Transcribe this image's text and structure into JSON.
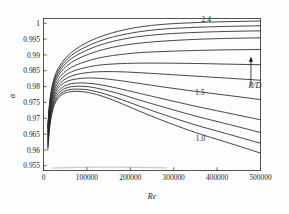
{
  "chart_data": {
    "type": "line",
    "title": "",
    "xlabel": "Re",
    "ylabel": "α",
    "xlim": [
      0,
      500000
    ],
    "ylim": [
      0.9535,
      1.0015
    ],
    "grid": false,
    "legend_position": "inline-annotations",
    "xticks": [
      0,
      100000,
      200000,
      300000,
      400000,
      500000
    ],
    "xtick_labels": [
      "0",
      "100000",
      "200000",
      "300000",
      "400000",
      "500000"
    ],
    "yticks": [
      0.955,
      0.96,
      0.965,
      0.97,
      0.975,
      0.98,
      0.985,
      0.99,
      0.995,
      1
    ],
    "ytick_labels": [
      "0.955",
      "0.96",
      "0.965",
      "0.97",
      "0.975",
      "0.98",
      "0.985",
      "0.99",
      "0.995",
      "1"
    ],
    "annotations": [
      {
        "text": "2.4",
        "x": 375000,
        "y": 1.0005,
        "name": "curve-label-2-4"
      },
      {
        "text": "1.5",
        "x": 360000,
        "y": 0.9772,
        "name": "curve-label-1-5"
      },
      {
        "text": "1.0",
        "x": 362000,
        "y": 0.9628,
        "name": "curve-label-1-0"
      },
      {
        "text": "R/D",
        "x": 487000,
        "y": 0.9795,
        "name": "ratio-axis-label"
      }
    ],
    "direction_arrow": {
      "name": "r-over-d-increase-arrow",
      "description": "upward arrow indicating increasing R/D",
      "x": 478000,
      "y_start": 0.9805,
      "y_end": 0.9895
    },
    "series": [
      {
        "name": "R/D = 1.0",
        "label": "1.0",
        "x": [
          10000,
          14000,
          20000,
          28000,
          40000,
          55000,
          75000,
          100000,
          130000,
          170000,
          220000,
          280000,
          350000,
          420000,
          500000
        ],
        "values": [
          0.96,
          0.9668,
          0.9718,
          0.9751,
          0.9772,
          0.9782,
          0.9785,
          0.9782,
          0.9772,
          0.9752,
          0.9723,
          0.969,
          0.9655,
          0.9625,
          0.959
        ]
      },
      {
        "name": "R/D = 1.13",
        "label": "",
        "x": [
          10000,
          14000,
          20000,
          28000,
          40000,
          55000,
          75000,
          100000,
          130000,
          170000,
          220000,
          280000,
          350000,
          420000,
          500000
        ],
        "values": [
          0.9608,
          0.9676,
          0.9726,
          0.9758,
          0.9778,
          0.9789,
          0.9792,
          0.979,
          0.9781,
          0.9764,
          0.9739,
          0.971,
          0.9679,
          0.9652,
          0.9621
        ]
      },
      {
        "name": "R/D = 1.26",
        "label": "",
        "x": [
          10000,
          14000,
          20000,
          28000,
          40000,
          55000,
          75000,
          100000,
          130000,
          170000,
          220000,
          280000,
          350000,
          420000,
          500000
        ],
        "values": [
          0.9616,
          0.9684,
          0.9734,
          0.9766,
          0.9786,
          0.9797,
          0.9801,
          0.98,
          0.9793,
          0.9779,
          0.9758,
          0.9734,
          0.9707,
          0.9683,
          0.9655
        ]
      },
      {
        "name": "R/D = 1.38",
        "label": "",
        "x": [
          10000,
          14000,
          20000,
          28000,
          40000,
          55000,
          75000,
          100000,
          130000,
          170000,
          220000,
          280000,
          350000,
          420000,
          500000
        ],
        "values": [
          0.9624,
          0.9692,
          0.9742,
          0.9774,
          0.9794,
          0.9806,
          0.9811,
          0.9811,
          0.9806,
          0.9795,
          0.9779,
          0.976,
          0.9738,
          0.9718,
          0.9695
        ]
      },
      {
        "name": "R/D = 1.5",
        "label": "1.5",
        "x": [
          10000,
          14000,
          20000,
          28000,
          40000,
          55000,
          75000,
          100000,
          130000,
          170000,
          220000,
          280000,
          350000,
          420000,
          500000
        ],
        "values": [
          0.9632,
          0.97,
          0.975,
          0.9783,
          0.9804,
          0.9817,
          0.9824,
          0.9827,
          0.9826,
          0.982,
          0.981,
          0.9798,
          0.9785,
          0.9773,
          0.9759
        ]
      },
      {
        "name": "R/D = 1.62",
        "label": "",
        "x": [
          10000,
          14000,
          20000,
          28000,
          40000,
          55000,
          75000,
          100000,
          130000,
          170000,
          220000,
          280000,
          350000,
          420000,
          500000
        ],
        "values": [
          0.964,
          0.9708,
          0.9758,
          0.9791,
          0.9813,
          0.9828,
          0.9838,
          0.9844,
          0.9847,
          0.9847,
          0.9844,
          0.9839,
          0.9833,
          0.9827,
          0.982
        ]
      },
      {
        "name": "R/D = 1.75",
        "label": "",
        "x": [
          10000,
          14000,
          20000,
          28000,
          40000,
          55000,
          75000,
          100000,
          130000,
          170000,
          220000,
          280000,
          350000,
          420000,
          500000
        ],
        "values": [
          0.9648,
          0.9716,
          0.9766,
          0.98,
          0.9823,
          0.984,
          0.9852,
          0.9861,
          0.9868,
          0.9872,
          0.9874,
          0.9874,
          0.9873,
          0.9871,
          0.9869
        ]
      },
      {
        "name": "R/D = 1.9",
        "label": "",
        "x": [
          10000,
          14000,
          20000,
          28000,
          40000,
          55000,
          75000,
          100000,
          130000,
          170000,
          220000,
          280000,
          350000,
          420000,
          500000
        ],
        "values": [
          0.9656,
          0.9724,
          0.9774,
          0.9809,
          0.9834,
          0.9853,
          0.9868,
          0.988,
          0.9891,
          0.99,
          0.9907,
          0.9911,
          0.9914,
          0.9916,
          0.9917
        ]
      },
      {
        "name": "R/D = 2.05",
        "label": "",
        "x": [
          10000,
          14000,
          20000,
          28000,
          40000,
          55000,
          75000,
          100000,
          130000,
          170000,
          220000,
          280000,
          350000,
          420000,
          500000
        ],
        "values": [
          0.9663,
          0.9732,
          0.9783,
          0.9819,
          0.9846,
          0.9867,
          0.9885,
          0.99,
          0.9914,
          0.9927,
          0.9937,
          0.9944,
          0.9949,
          0.9952,
          0.9954
        ]
      },
      {
        "name": "R/D = 2.15",
        "label": "",
        "x": [
          10000,
          14000,
          20000,
          28000,
          40000,
          55000,
          75000,
          100000,
          130000,
          170000,
          220000,
          280000,
          350000,
          420000,
          500000
        ],
        "values": [
          0.9668,
          0.9738,
          0.979,
          0.9827,
          0.9855,
          0.9878,
          0.9898,
          0.9915,
          0.9931,
          0.9946,
          0.9958,
          0.9966,
          0.9971,
          0.9974,
          0.9976
        ]
      },
      {
        "name": "R/D = 2.28",
        "label": "",
        "x": [
          10000,
          14000,
          20000,
          28000,
          40000,
          55000,
          75000,
          100000,
          130000,
          170000,
          220000,
          280000,
          350000,
          420000,
          500000
        ],
        "values": [
          0.9672,
          0.9743,
          0.9796,
          0.9834,
          0.9863,
          0.9887,
          0.9909,
          0.9927,
          0.9944,
          0.996,
          0.9973,
          0.9982,
          0.9987,
          0.999,
          0.9992
        ]
      },
      {
        "name": "R/D = 2.4",
        "label": "2.4",
        "x": [
          10000,
          14000,
          20000,
          28000,
          40000,
          55000,
          75000,
          100000,
          130000,
          170000,
          220000,
          280000,
          350000,
          420000,
          500000
        ],
        "values": [
          0.9676,
          0.9748,
          0.9802,
          0.9841,
          0.9871,
          0.9896,
          0.9919,
          0.9939,
          0.9957,
          0.9974,
          0.9988,
          0.9997,
          1.0002,
          1.0005,
          1.0007
        ]
      }
    ]
  }
}
